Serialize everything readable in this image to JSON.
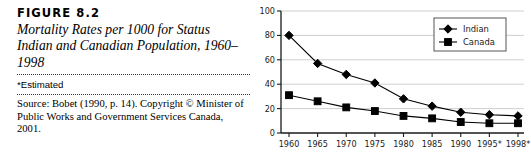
{
  "caption": {
    "figure_label": "FIGURE 8.2",
    "title": "Mortality Rates per 1000 for Status Indian and Canadian Population, 1960–1998",
    "footnote": "*Estimated",
    "source": "Source: Bobet (1990, p. 14). Copyright © Minister of Public Works and Government Services Canada, 2001."
  },
  "chart_data": {
    "type": "line",
    "title": "",
    "xlabel": "",
    "ylabel": "",
    "categories": [
      "1960",
      "1965",
      "1970",
      "1975",
      "1980",
      "1985",
      "1990",
      "1995*",
      "1998*"
    ],
    "ylim": [
      0,
      100
    ],
    "yticks": [
      0,
      20,
      40,
      60,
      80,
      100
    ],
    "grid": "horizontal",
    "legend_position": "top-right",
    "series": [
      {
        "name": "Indian",
        "marker": "diamond",
        "color": "#000000",
        "values": [
          80,
          57,
          48,
          41,
          28,
          22,
          17,
          15,
          14
        ]
      },
      {
        "name": "Canada",
        "marker": "square",
        "color": "#000000",
        "values": [
          31,
          26,
          21,
          18,
          14,
          12,
          9,
          8,
          8
        ]
      }
    ]
  }
}
